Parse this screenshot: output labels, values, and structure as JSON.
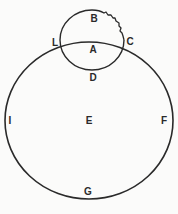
{
  "figure": {
    "stroke_color": "#2a2a2a",
    "background": "#fbfbfa",
    "large_circle": {
      "label_center": "E",
      "points": {
        "left": "I",
        "right": "F",
        "bottom": "G"
      }
    },
    "small_circle": {
      "label_center": "A",
      "points": {
        "top": "B",
        "bottom": "D",
        "left_intersection": "L",
        "right_intersection": "C"
      },
      "note": "wavy edge between B and C"
    },
    "labels": {
      "B": "B",
      "L": "L",
      "C": "C",
      "A": "A",
      "D": "D",
      "E": "E",
      "I": "I",
      "F": "F",
      "G": "G"
    },
    "caption": "Fig. 1"
  }
}
